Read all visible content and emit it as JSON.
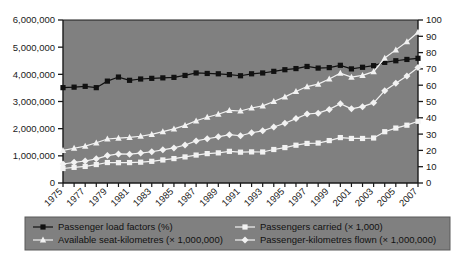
{
  "chart_data": {
    "type": "line",
    "title": "",
    "subtitle": "",
    "xlabel": "",
    "ylabel": "",
    "y2label": "",
    "grid": false,
    "legend_position": "bottom",
    "plot_background": "#808080",
    "x": [
      1975,
      1976,
      1977,
      1978,
      1979,
      1980,
      1981,
      1982,
      1983,
      1984,
      1985,
      1986,
      1987,
      1988,
      1989,
      1990,
      1991,
      1992,
      1993,
      1994,
      1995,
      1996,
      1997,
      1998,
      1999,
      2000,
      2001,
      2002,
      2003,
      2004,
      2005,
      2006,
      2007
    ],
    "x_tick_labels": [
      "1975",
      "1977",
      "1979",
      "1981",
      "1983",
      "1985",
      "1987",
      "1989",
      "1991",
      "1993",
      "1995",
      "1997",
      "1999",
      "2001",
      "2003",
      "2005",
      "2007"
    ],
    "ylim": [
      0,
      6000000
    ],
    "y_ticks": [
      0,
      1000000,
      2000000,
      3000000,
      4000000,
      5000000,
      6000000
    ],
    "y_tick_labels": [
      "0",
      "1,000,000",
      "2,000,000",
      "3,000,000",
      "4,000,000",
      "5,000,000",
      "6,000,000"
    ],
    "y2lim": [
      0,
      100
    ],
    "y2_ticks": [
      0,
      10,
      20,
      30,
      40,
      50,
      60,
      70,
      80,
      90,
      100
    ],
    "y2_tick_labels": [
      "0",
      "10",
      "20",
      "30",
      "40",
      "50",
      "60",
      "70",
      "80",
      "90",
      "100"
    ],
    "series": [
      {
        "name": "Passenger load factors (%)",
        "axis": "right",
        "marker": "square",
        "color": "#111111",
        "line_color": "#111111",
        "values": [
          58.5,
          58.8,
          59.3,
          58.5,
          62.5,
          65.0,
          63.0,
          63.8,
          64.2,
          64.5,
          64.8,
          66.0,
          67.5,
          67.2,
          67.0,
          66.5,
          65.8,
          67.0,
          67.5,
          68.5,
          69.5,
          70.2,
          71.5,
          70.5,
          70.8,
          72.2,
          70.0,
          71.0,
          72.0,
          74.0,
          75.0,
          75.8,
          76.5
        ]
      },
      {
        "name": "Passengers carried (× 1,000)",
        "axis": "left",
        "marker": "square",
        "color": "#f2f2f2",
        "line_color": "#f2f2f2",
        "values": [
          534000,
          576000,
          610000,
          679000,
          754000,
          748000,
          752000,
          766000,
          798000,
          848000,
          899000,
          960000,
          1028000,
          1082000,
          1109000,
          1165000,
          1135000,
          1146000,
          1142000,
          1233000,
          1304000,
          1391000,
          1457000,
          1471000,
          1562000,
          1672000,
          1640000,
          1639000,
          1657000,
          1888000,
          2022000,
          2128000,
          2271000
        ]
      },
      {
        "name": "Available seat-kilometres (× 1,000,000)",
        "axis": "left",
        "marker": "triangle",
        "color": "#f2f2f2",
        "line_color": "#f2f2f2",
        "values": [
          1200000,
          1280000,
          1360000,
          1480000,
          1620000,
          1650000,
          1680000,
          1720000,
          1790000,
          1890000,
          1990000,
          2120000,
          2290000,
          2420000,
          2530000,
          2670000,
          2650000,
          2760000,
          2840000,
          3000000,
          3170000,
          3370000,
          3550000,
          3640000,
          3830000,
          4040000,
          3900000,
          3960000,
          4100000,
          4600000,
          4900000,
          5200000,
          5550000
        ]
      },
      {
        "name": "Passenger-kilometres flown (× 1,000,000)",
        "axis": "left",
        "marker": "diamond",
        "color": "#f2f2f2",
        "line_color": "#f2f2f2",
        "values": [
          700000,
          760000,
          810000,
          890000,
          1010000,
          1070000,
          1060000,
          1100000,
          1150000,
          1220000,
          1290000,
          1400000,
          1550000,
          1630000,
          1700000,
          1780000,
          1740000,
          1850000,
          1920000,
          2060000,
          2200000,
          2370000,
          2540000,
          2570000,
          2710000,
          2920000,
          2730000,
          2810000,
          2950000,
          3400000,
          3670000,
          3940000,
          4250000
        ]
      }
    ],
    "legend_entries": [
      {
        "label": "Passenger load factors (%)",
        "marker": "square",
        "color": "#111111"
      },
      {
        "label": "Passengers carried (× 1,000)",
        "marker": "square",
        "color": "#f2f2f2"
      },
      {
        "label": "Available seat-kilometres (× 1,000,000)",
        "marker": "triangle",
        "color": "#f2f2f2"
      },
      {
        "label": "Passenger-kilometres flown (× 1,000,000)",
        "marker": "diamond",
        "color": "#f2f2f2"
      }
    ]
  }
}
